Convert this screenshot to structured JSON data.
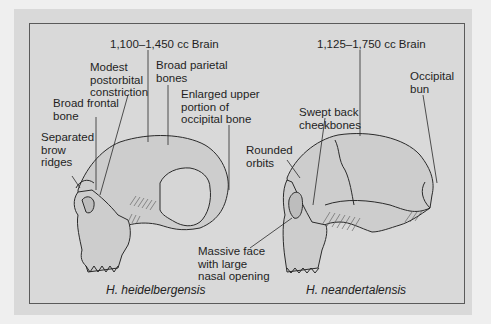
{
  "figure": {
    "left": {
      "species": "H. heidelbergensis",
      "brain_size": "1,100–1,450 cc Brain",
      "labels": {
        "postorbital": "Modest\npostorbital\nconstriction",
        "parietal": "Broad parietal\nbones",
        "frontal": "Broad frontal\nbone",
        "occipital": "Enlarged upper\nportion of\noccipital bone",
        "brow": "Separated\nbrow\nridges"
      }
    },
    "right": {
      "species": "H. neandertalensis",
      "brain_size": "1,125–1,750 cc Brain",
      "labels": {
        "bun": "Occipital\nbun",
        "cheek": "Swept back\ncheekbones",
        "orbits": "Rounded\norbits",
        "face": "Massive face\nwith large\nnasal opening"
      }
    },
    "colors": {
      "background": "#efefef",
      "panel": "#d9d9d9",
      "frame": "#5a5a5a",
      "bone_fill": "#cfcfcf",
      "line": "#2a2a2a"
    }
  }
}
